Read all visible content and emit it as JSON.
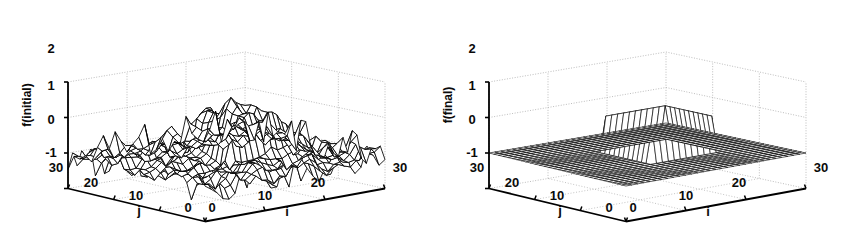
{
  "figure": {
    "background": "#ffffff",
    "line_color": "#000000",
    "grid_color": "#b8b8b8",
    "panel_count": 2
  },
  "chart_data": [
    {
      "type": "surface",
      "panel": "left",
      "title": "",
      "zlabel": "f(initial)",
      "xlabel": "i",
      "ylabel": "j",
      "z_ticks": [
        "2",
        "1",
        "0",
        "-1"
      ],
      "zlim": [
        -1,
        2
      ],
      "x_ticks": [
        "0",
        "10",
        "20",
        "30"
      ],
      "xlim": [
        0,
        30
      ],
      "y_ticks": [
        "30",
        "20",
        "10",
        "0"
      ],
      "ylim": [
        0,
        30
      ],
      "grid": true,
      "legend": "none",
      "render_style": "white-faced wireframe mesh",
      "description": "Noisy random field of amplitude about +/-0.5 around 0, with a raised square plateau of height 1 in the central region (roughly i=12..22, j=10..20).",
      "plateau": {
        "height": 1.0,
        "baseline": 0.0,
        "i_range": [
          12,
          22
        ],
        "j_range": [
          10,
          20
        ]
      },
      "noise": {
        "mean": 0.0,
        "approx_amplitude": 0.5
      }
    },
    {
      "type": "surface",
      "panel": "right",
      "title": "",
      "zlabel": "f(final)",
      "xlabel": "i",
      "ylabel": "j",
      "z_ticks": [
        "2",
        "1",
        "0",
        "-1"
      ],
      "zlim": [
        -1,
        2
      ],
      "x_ticks": [
        "0",
        "10",
        "20",
        "30"
      ],
      "xlim": [
        0,
        30
      ],
      "y_ticks": [
        "30",
        "20",
        "10",
        "0"
      ],
      "ylim": [
        0,
        30
      ],
      "grid": true,
      "legend": "none",
      "render_style": "dense dark wireframe mesh",
      "description": "Flat denoised plane at 0 with a clean raised square plateau of height 1 in the central region (roughly i=12..22, j=10..20).",
      "plateau": {
        "height": 1.0,
        "baseline": 0.0,
        "i_range": [
          12,
          22
        ],
        "j_range": [
          10,
          20
        ]
      },
      "noise": {
        "mean": 0.0,
        "approx_amplitude": 0.0
      }
    }
  ],
  "left_panel": {
    "zlabel": "f(initial)",
    "xlabel": "i",
    "ylabel": "j",
    "z_ticks": [
      "2",
      "1",
      "0",
      "-1"
    ],
    "x_ticks": [
      "0",
      "10",
      "20",
      "30"
    ],
    "y_ticks": [
      "30",
      "20",
      "10",
      "0"
    ]
  },
  "right_panel": {
    "zlabel": "f(final)",
    "xlabel": "i",
    "ylabel": "j",
    "z_ticks": [
      "2",
      "1",
      "0",
      "-1"
    ],
    "x_ticks": [
      "0",
      "10",
      "20",
      "30"
    ],
    "y_ticks": [
      "30",
      "20",
      "10",
      "0"
    ]
  }
}
